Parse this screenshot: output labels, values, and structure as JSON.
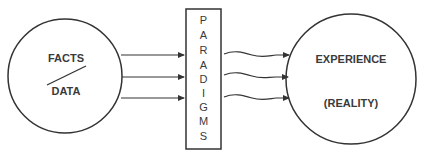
{
  "diagram": {
    "left_node": {
      "top_label": "FACTS",
      "bottom_label": "DATA"
    },
    "middle_node": {
      "label": "PARADIGMS",
      "letters": [
        "P",
        "A",
        "R",
        "A",
        "D",
        "I",
        "G",
        "M",
        "S"
      ]
    },
    "right_node": {
      "top_label": "EXPERIENCE",
      "bottom_label": "(REALITY)"
    },
    "edges": [
      {
        "from": "FACTS/DATA",
        "to": "PARADIGMS",
        "style": "straight-arrow",
        "count": 3
      },
      {
        "from": "PARADIGMS",
        "to": "EXPERIENCE (REALITY)",
        "style": "wavy-arrow",
        "count": 3
      }
    ],
    "colors": {
      "stroke": "#333333",
      "text": "#3a3a3a",
      "background": "#ffffff"
    }
  }
}
